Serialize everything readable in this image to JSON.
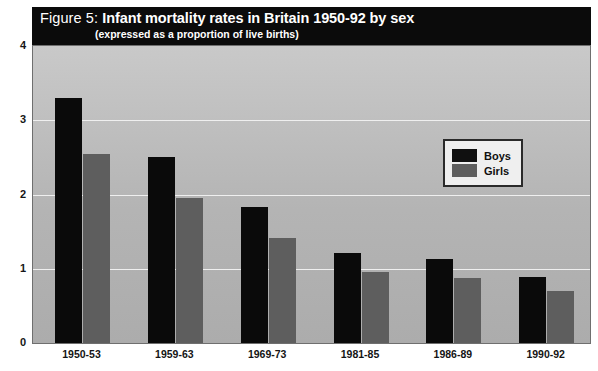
{
  "title": {
    "prefix": "Figure 5: ",
    "main": "Infant mortality rates in Britain 1950-92 by sex",
    "subtitle": "(expressed as a proportion of live births)"
  },
  "legend": {
    "position": "inside-top-right",
    "items": [
      {
        "label": "Boys",
        "color": "#101010"
      },
      {
        "label": "Girls",
        "color": "#5e5e5e"
      }
    ]
  },
  "colors": {
    "boys": "#0a0a0a",
    "girls": "#5e5e5e",
    "plot_background": "#b8b8b8",
    "gridline": "#efefef",
    "banner": "#0b0b0b",
    "banner_text": "#ffffff"
  },
  "chart_data": {
    "type": "bar",
    "title": "Figure 5: Infant mortality rates in Britain 1950-92 by sex",
    "subtitle": "(expressed as a proportion of live births)",
    "xlabel": "",
    "ylabel": "",
    "ylim": [
      0,
      4
    ],
    "yticks": [
      0,
      1,
      2,
      3,
      4
    ],
    "ytick_labels": [
      "0",
      "1",
      "2",
      "3",
      "4"
    ],
    "grid": true,
    "grid_axis": "y",
    "legend_position": "inside-top-right",
    "categories": [
      "1950-53",
      "1959-63",
      "1969-73",
      "1981-85",
      "1986-89",
      "1990-92"
    ],
    "series": [
      {
        "name": "Boys",
        "color": "#0a0a0a",
        "values": [
          3.3,
          2.5,
          1.83,
          1.21,
          1.13,
          0.89
        ]
      },
      {
        "name": "Girls",
        "color": "#5e5e5e",
        "values": [
          2.55,
          1.95,
          1.42,
          0.96,
          0.88,
          0.7
        ]
      }
    ]
  }
}
